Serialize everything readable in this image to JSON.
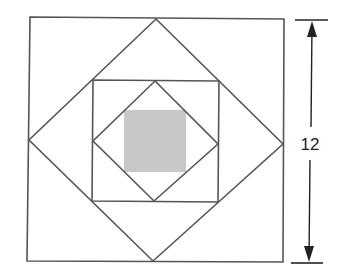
{
  "figure": {
    "dimension_label": "12",
    "colors": {
      "line": "#555555",
      "shaded": "#c8c8c8",
      "background": "#ffffff"
    },
    "shapes": [
      {
        "name": "outer-square",
        "type": "square"
      },
      {
        "name": "outer-diamond",
        "type": "square-rotated-45"
      },
      {
        "name": "middle-square",
        "type": "square"
      },
      {
        "name": "inner-diamond",
        "type": "square-rotated-45"
      },
      {
        "name": "shaded-square",
        "type": "square",
        "shaded": true
      }
    ]
  }
}
